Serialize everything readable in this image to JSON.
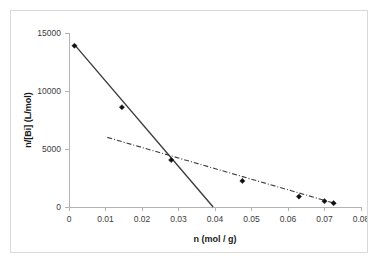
{
  "chart_data": {
    "type": "scatter",
    "title": "",
    "xlabel": "n (mol / g)",
    "ylabel": "n/[Bi] (L/mol)",
    "xlim": [
      0,
      0.08
    ],
    "ylim": [
      0,
      15000
    ],
    "xticks": [
      "0",
      "0.01",
      "0.02",
      "0.03",
      "0.04",
      "0.05",
      "0.06",
      "0.07",
      "0.08"
    ],
    "xtick_values": [
      0,
      0.01,
      0.02,
      0.03,
      0.04,
      0.05,
      0.06,
      0.07,
      0.08
    ],
    "yticks": [
      "0",
      "5000",
      "10000",
      "15000"
    ],
    "ytick_values": [
      0,
      5000,
      10000,
      15000
    ],
    "grid": false,
    "legend": "none",
    "series": [
      {
        "name": "data-points",
        "marker": "filled-diamond",
        "x": [
          0.0015,
          0.0145,
          0.028,
          0.0475,
          0.063,
          0.07,
          0.0725
        ],
        "y": [
          13900,
          8600,
          4050,
          2250,
          900,
          500,
          330
        ]
      },
      {
        "name": "steep-fit-line",
        "style": "solid",
        "x": [
          0.0015,
          0.0395
        ],
        "y": [
          14000,
          0
        ]
      },
      {
        "name": "shallow-fit-line",
        "style": "dash-dot",
        "x": [
          0.0105,
          0.0735
        ],
        "y": [
          6000,
          250
        ]
      }
    ]
  }
}
